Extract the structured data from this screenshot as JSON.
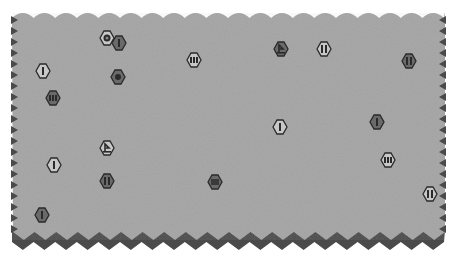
{
  "board": {
    "type": "hex-wargame-map",
    "field_color": "#a9a9a9",
    "edge_color": "#4a4a4a",
    "light_piece_fill": "#c8c8c8",
    "dark_piece_fill": "#6a6a6a",
    "piece_outline": "#2a2a2a"
  },
  "pieces": [
    {
      "id": "p1",
      "x": 107,
      "y": 38,
      "style": "light",
      "symbol": "dot-ring"
    },
    {
      "id": "p2",
      "x": 119,
      "y": 43,
      "style": "dark",
      "symbol": "bar-1"
    },
    {
      "id": "p3",
      "x": 43,
      "y": 71,
      "style": "light",
      "symbol": "bar-1"
    },
    {
      "id": "p4",
      "x": 118,
      "y": 77,
      "style": "dark",
      "symbol": "dot"
    },
    {
      "id": "p5",
      "x": 194,
      "y": 60,
      "style": "light",
      "symbol": "bar-3"
    },
    {
      "id": "p6",
      "x": 53,
      "y": 98,
      "style": "dark",
      "symbol": "bar-3"
    },
    {
      "id": "p7",
      "x": 281,
      "y": 49,
      "style": "dark",
      "symbol": "flag"
    },
    {
      "id": "p8",
      "x": 324,
      "y": 49,
      "style": "light",
      "symbol": "bar-2"
    },
    {
      "id": "p9",
      "x": 409,
      "y": 61,
      "style": "dark",
      "symbol": "bar-2"
    },
    {
      "id": "p10",
      "x": 280,
      "y": 127,
      "style": "light",
      "symbol": "bar-1"
    },
    {
      "id": "p11",
      "x": 377,
      "y": 122,
      "style": "dark",
      "symbol": "bar-1"
    },
    {
      "id": "p12",
      "x": 388,
      "y": 160,
      "style": "light",
      "symbol": "bar-3"
    },
    {
      "id": "p13",
      "x": 107,
      "y": 148,
      "style": "light",
      "symbol": "flag"
    },
    {
      "id": "p14",
      "x": 54,
      "y": 165,
      "style": "light",
      "symbol": "bar-1"
    },
    {
      "id": "p15",
      "x": 107,
      "y": 181,
      "style": "dark",
      "symbol": "bar-2"
    },
    {
      "id": "p16",
      "x": 215,
      "y": 182,
      "style": "dark",
      "symbol": "block"
    },
    {
      "id": "p17",
      "x": 430,
      "y": 194,
      "style": "light",
      "symbol": "bar-2"
    },
    {
      "id": "p18",
      "x": 42,
      "y": 215,
      "style": "dark",
      "symbol": "bar-1"
    }
  ]
}
